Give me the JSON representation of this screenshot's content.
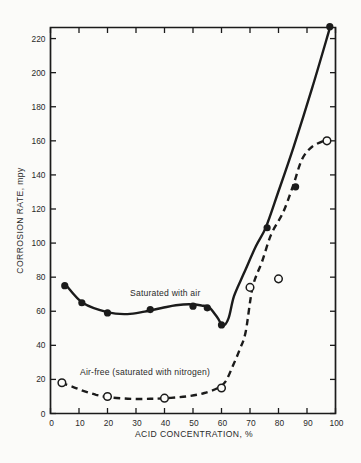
{
  "chart_data": {
    "type": "line",
    "title": "",
    "xlabel": "ACID CONCENTRATION, %",
    "ylabel": "CORROSION RATE, mpy",
    "xlim": [
      0,
      100
    ],
    "ylim": [
      0,
      226.5
    ],
    "x_ticks": [
      0,
      10,
      20,
      30,
      40,
      50,
      60,
      70,
      80,
      90,
      100
    ],
    "y_ticks": [
      0,
      20,
      40,
      60,
      80,
      100,
      120,
      140,
      160,
      180,
      200,
      220
    ],
    "grid": false,
    "legend_position": "inline-annotations",
    "ink_color": "#1b1b1b",
    "paper_color": "#fbfbf9",
    "series": [
      {
        "name": "saturated-with-air",
        "label": "Saturated with air",
        "line_style": "solid",
        "marker": "filled-circle",
        "points": [
          [
            5,
            75
          ],
          [
            11,
            65
          ],
          [
            20,
            59
          ],
          [
            35,
            61
          ],
          [
            50,
            63
          ],
          [
            55,
            62
          ],
          [
            60,
            52
          ],
          [
            76,
            109
          ],
          [
            86,
            133
          ],
          [
            98,
            227
          ]
        ],
        "curve": [
          [
            5.4,
            75.4
          ],
          [
            11.4,
            64.8
          ],
          [
            20.2,
            59.3
          ],
          [
            27,
            58.3
          ],
          [
            33,
            59.8
          ],
          [
            39,
            61.9
          ],
          [
            44,
            63.5
          ],
          [
            49,
            64.1
          ],
          [
            53,
            63.4
          ],
          [
            55.6,
            62.3
          ],
          [
            58.5,
            56.5
          ],
          [
            60.5,
            51.6
          ],
          [
            62.5,
            56
          ],
          [
            64.4,
            68.9
          ],
          [
            67.9,
            82.4
          ],
          [
            72.1,
            98.2
          ],
          [
            75.6,
            109.4
          ],
          [
            79.8,
            129.4
          ],
          [
            85.4,
            156.9
          ],
          [
            91.8,
            190.9
          ],
          [
            98.1,
            226.7
          ]
        ]
      },
      {
        "name": "air-free-nitrogen",
        "label": "Air-free (saturated with nitrogen)",
        "line_style": "dashed",
        "marker": "open-circle",
        "points": [
          [
            4,
            18
          ],
          [
            20,
            10
          ],
          [
            40,
            9
          ],
          [
            60,
            15
          ],
          [
            70,
            74
          ],
          [
            80,
            79
          ],
          [
            97,
            160
          ]
        ],
        "curve": [
          [
            3.7,
            18
          ],
          [
            8,
            15.5
          ],
          [
            12,
            13
          ],
          [
            16,
            11
          ],
          [
            20,
            9.7
          ],
          [
            25,
            8.9
          ],
          [
            30,
            8.5
          ],
          [
            35,
            8.6
          ],
          [
            39,
            8.8
          ],
          [
            44,
            9.4
          ],
          [
            49,
            10.3
          ],
          [
            54,
            12
          ],
          [
            58.8,
            15
          ],
          [
            61.5,
            19
          ],
          [
            64,
            28
          ],
          [
            66.5,
            38
          ],
          [
            68.5,
            48
          ],
          [
            70.9,
            74
          ],
          [
            74.2,
            89
          ],
          [
            77.4,
            105
          ],
          [
            81.6,
            118
          ],
          [
            85.1,
            133.5
          ],
          [
            88.2,
            149
          ],
          [
            91.8,
            156.5
          ],
          [
            96.6,
            160.5
          ]
        ]
      }
    ]
  }
}
